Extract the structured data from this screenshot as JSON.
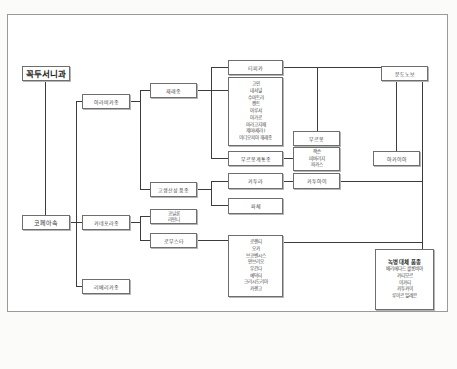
{
  "diagram": {
    "title_root": "꼭두서니과",
    "genus": "코페아속",
    "species": {
      "arabica": "아라비카종",
      "canephora": "카네포라종",
      "liberica": "리베리카종"
    },
    "arabica_groups": {
      "traditional": "재래종",
      "high_yield": "고생산성 품종"
    },
    "traditional_varieties": {
      "typica": "티피카",
      "typica_descendants": [
        "고인",
        "내셔널",
        "수마트라",
        "켄트",
        "아루샤",
        "아가로",
        "마라고지페",
        "제마(세라)",
        "이디오피아 재래종"
      ],
      "bourbon_group": "부르봉계통종"
    },
    "bourbon": {
      "label": "부르봉",
      "descendants": [
        "잭슨",
        "미버리지",
        "파카스"
      ]
    },
    "high_yield_varieties": {
      "caturra": "카투라",
      "catuai": "카투아이",
      "pache": "파체"
    },
    "mundo_novo": "문도노보",
    "acaia": "아카이아",
    "canephora_varieties": {
      "conilon": [
        "코닐론",
        "라탄니"
      ],
      "robusta": "로부스타",
      "robusta_list": [
        "로렌티",
        "오카",
        "브코벤시스",
        "안브리오",
        "우간다",
        "예덕터",
        "크리시도리아",
        "카렌고"
      ]
    },
    "rust_resistant": {
      "heading": "녹병 대체 품종",
      "items": [
        "베리에다드 콜롬비아",
        "카티모르",
        "이카티",
        "카투카이",
        "루이르 일레븐"
      ]
    }
  }
}
